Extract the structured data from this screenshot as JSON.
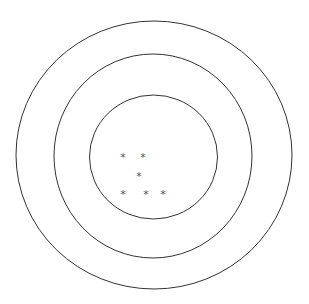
{
  "diagram": {
    "type": "target",
    "background": "#ffffff",
    "stroke_color": "#333333",
    "mark_color": "#555555",
    "mark_symbol": "*",
    "rings": [
      {
        "name": "outer",
        "cx": 154,
        "cy": 155,
        "rx": 138,
        "ry": 134
      },
      {
        "name": "middle",
        "cx": 153,
        "cy": 156,
        "rx": 99,
        "ry": 102
      },
      {
        "name": "inner",
        "cx": 153.5,
        "cy": 157,
        "rx": 64,
        "ry": 62
      }
    ],
    "marks": [
      {
        "x": 123,
        "y": 157
      },
      {
        "x": 143,
        "y": 157
      },
      {
        "x": 139,
        "y": 176
      },
      {
        "x": 123,
        "y": 194
      },
      {
        "x": 146,
        "y": 194
      },
      {
        "x": 163,
        "y": 194
      }
    ]
  }
}
